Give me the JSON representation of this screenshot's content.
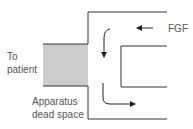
{
  "diagram": {
    "labels": {
      "to_patient_line1": "To",
      "to_patient_line2": "patient",
      "dead_space_line1": "Apparatus",
      "dead_space_line2": "dead space",
      "fgf": "FGF"
    },
    "colors": {
      "line": "#333333",
      "dead_space_fill": "#cccccc",
      "text": "#555555"
    }
  }
}
